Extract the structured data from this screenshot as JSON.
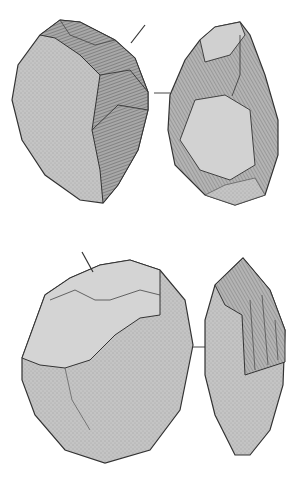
{
  "figure": {
    "type": "archaeological stone tool illustration",
    "background": "#ffffff",
    "colors": {
      "cortex": "#bdbdbd",
      "cortex_dark": "#9a9a9a",
      "flake_scar": "#8c8c8c",
      "flake_light": "#d4d4d4",
      "outline": "#3a3a3a"
    },
    "artifacts": [
      {
        "id": "artifact-1",
        "views": [
          "front-view",
          "side-view"
        ],
        "has_arrow": true,
        "has_profile_line": true
      },
      {
        "id": "artifact-2",
        "views": [
          "front-view",
          "side-view"
        ],
        "has_arrow": true,
        "has_profile_line": true
      }
    ]
  }
}
